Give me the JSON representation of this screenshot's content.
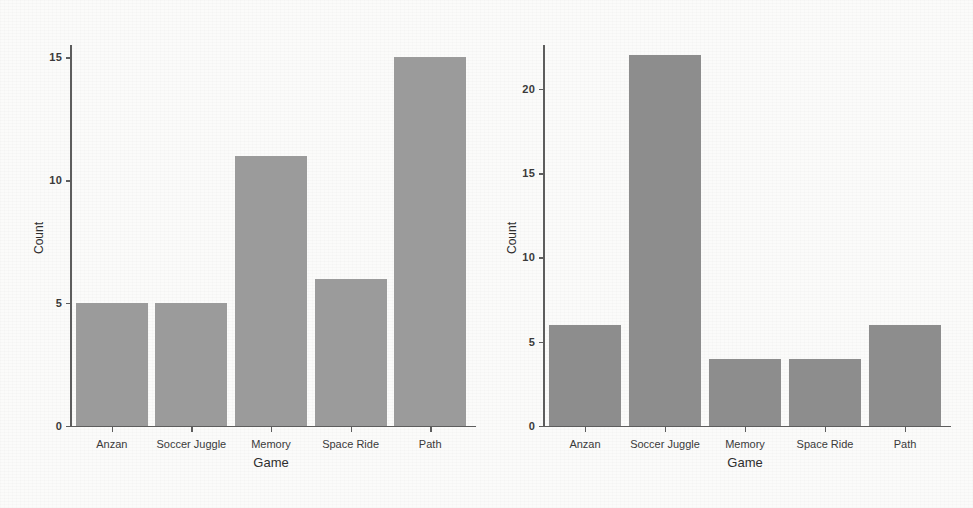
{
  "figure": {
    "background_color": "#fbfbfa",
    "panels": [
      {
        "id": "left",
        "name": "left-bar-chart",
        "bar_color": "#9b9b9b",
        "axis_color": "#5d5d5d"
      },
      {
        "id": "right",
        "name": "right-bar-chart",
        "bar_color": "#8d8d8d",
        "axis_color": "#5d5d5d"
      }
    ],
    "ghost_marginalia": [
      "bleed-through text",
      "scanned page verso"
    ]
  },
  "chart_data": [
    {
      "type": "bar",
      "panel": "left",
      "title": "",
      "xlabel": "Game",
      "ylabel": "Count",
      "categories": [
        "Anzan",
        "Soccer Juggle",
        "Memory",
        "Space Ride",
        "Path"
      ],
      "values": [
        5,
        5,
        11,
        6,
        15
      ],
      "ylim": [
        0,
        15.5
      ],
      "yticks": [
        0,
        5,
        10,
        15
      ],
      "ytick_labels": [
        "0",
        "5",
        "10",
        "15"
      ],
      "grid": false,
      "legend": "none"
    },
    {
      "type": "bar",
      "panel": "right",
      "title": "",
      "xlabel": "Game",
      "ylabel": "Count",
      "categories": [
        "Anzan",
        "Soccer Juggle",
        "Memory",
        "Space Ride",
        "Path"
      ],
      "values": [
        6,
        22,
        4,
        4,
        6
      ],
      "ylim": [
        0,
        22.6
      ],
      "yticks": [
        0,
        5,
        10,
        15,
        20
      ],
      "ytick_labels": [
        "0",
        "5",
        "10",
        "15",
        "20"
      ],
      "grid": false,
      "legend": "none"
    }
  ]
}
